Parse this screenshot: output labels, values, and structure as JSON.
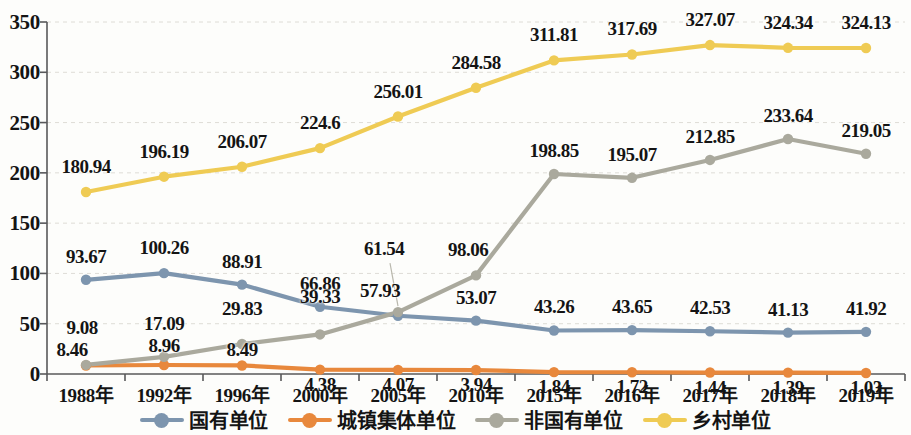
{
  "chart_data": {
    "type": "line",
    "title": "",
    "xlabel": "",
    "ylabel": "",
    "ylim": [
      0,
      350
    ],
    "yticks": [
      0,
      50,
      100,
      150,
      200,
      250,
      300,
      350
    ],
    "grid": true,
    "legend_position": "bottom",
    "categories": [
      "1988年",
      "1992年",
      "1996年",
      "2000年",
      "2005年",
      "2010年",
      "2015年",
      "2016年",
      "2017年",
      "2018年",
      "2019年"
    ],
    "series": [
      {
        "name": "国有单位",
        "color": "#7d95ae",
        "values": [
          93.67,
          100.26,
          88.91,
          66.86,
          57.93,
          53.07,
          43.26,
          43.65,
          42.53,
          41.13,
          41.92
        ],
        "labels": [
          "93.67",
          "100.26",
          "88.91",
          "66.86",
          "57.93",
          "53.07",
          "43.26",
          "43.65",
          "42.53",
          "41.13",
          "41.92"
        ]
      },
      {
        "name": "城镇集体单位",
        "color": "#e8883c",
        "values": [
          8.46,
          8.96,
          8.49,
          4.38,
          4.07,
          3.94,
          1.84,
          1.72,
          1.44,
          1.39,
          1.03
        ],
        "labels": [
          "8.46",
          "8.96",
          "8.49",
          "4.38",
          "4.07",
          "3.94",
          "1.84",
          "1.72",
          "1.44",
          "1.39",
          "1.03"
        ]
      },
      {
        "name": "非国有单位",
        "color": "#aaa99d",
        "values": [
          9.08,
          17.09,
          29.83,
          39.33,
          61.54,
          98.06,
          198.85,
          195.07,
          212.85,
          233.64,
          219.05
        ],
        "labels": [
          "9.08",
          "17.09",
          "29.83",
          "39.33",
          "61.54",
          "98.06",
          "198.85",
          "195.07",
          "212.85",
          "233.64",
          "219.05"
        ]
      },
      {
        "name": "乡村单位",
        "color": "#efcb54",
        "values": [
          180.94,
          196.19,
          206.07,
          224.6,
          256.01,
          284.58,
          311.81,
          317.69,
          327.07,
          324.34,
          324.13
        ],
        "labels": [
          "180.94",
          "196.19",
          "206.07",
          "224.6",
          "256.01",
          "284.58",
          "311.81",
          "317.69",
          "327.07",
          "324.34",
          "324.13"
        ]
      }
    ]
  },
  "legend": {
    "items": [
      {
        "label": "国有单位",
        "color": "#7d95ae"
      },
      {
        "label": "城镇集体单位",
        "color": "#e8883c"
      },
      {
        "label": "非国有单位",
        "color": "#aaa99d"
      },
      {
        "label": "乡村单位",
        "color": "#efcb54"
      }
    ]
  },
  "axes": {
    "y_tick_labels": [
      "0",
      "50",
      "100",
      "150",
      "200",
      "250",
      "300",
      "350"
    ],
    "x_tick_labels": [
      "1988年",
      "1992年",
      "1996年",
      "2000年",
      "2005年",
      "2010年",
      "2015年",
      "2016年",
      "2017年",
      "2018年",
      "2019年"
    ]
  }
}
